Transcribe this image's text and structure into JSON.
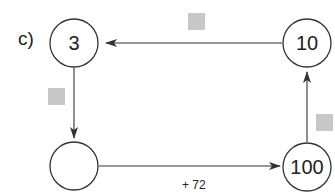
{
  "part_label": "c)",
  "nodes": [
    {
      "id": "top-left",
      "value": "3"
    },
    {
      "id": "top-right",
      "value": "10"
    },
    {
      "id": "bottom-left",
      "value": ""
    },
    {
      "id": "bottom-right",
      "value": "100"
    }
  ],
  "edges": [
    {
      "from": "top-right",
      "to": "top-left",
      "label": "",
      "label_hidden": true
    },
    {
      "from": "top-left",
      "to": "bottom-left",
      "label": "",
      "label_hidden": true
    },
    {
      "from": "bottom-left",
      "to": "bottom-right",
      "label": "+ 72"
    },
    {
      "from": "bottom-right",
      "to": "top-right",
      "label": "",
      "label_hidden": true
    }
  ],
  "colors": {
    "line": "#333333",
    "placeholder_box": "#c8c8c8"
  }
}
